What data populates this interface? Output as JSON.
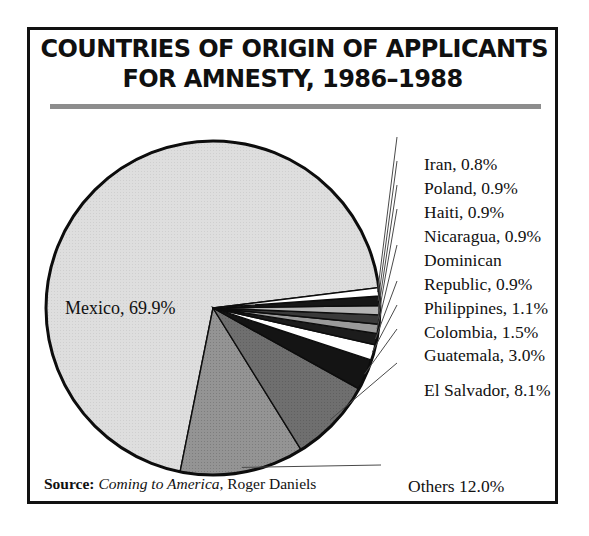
{
  "title": {
    "line1": "COUNTRIES OF ORIGIN OF APPLICANTS",
    "line2": "FOR AMNESTY, 1986–1988"
  },
  "source": {
    "label": "Source:",
    "work": "Coming to America",
    "author": ", Roger Daniels"
  },
  "bleed_text": "When争 of the applicants sought to today",
  "chart_data": {
    "type": "pie",
    "title": "COUNTRIES OF ORIGIN OF APPLICANTS FOR AMNESTY, 1986–1988",
    "unit": "percent",
    "legend": "none",
    "labels_inline": true,
    "categories": [
      "Mexico",
      "Others",
      "El Salvador",
      "Guatemala",
      "Colombia",
      "Philippines",
      "Dominican Republic",
      "Nicaragua",
      "Haiti",
      "Poland",
      "Iran"
    ],
    "values": [
      69.9,
      12.0,
      8.1,
      3.0,
      1.5,
      1.1,
      0.9,
      0.9,
      0.9,
      0.9,
      0.8
    ],
    "slice_labels": [
      "Mexico, 69.9%",
      "Others 12.0%",
      "El Salvador, 8.1%",
      "Guatemala, 3.0%",
      "Colombia, 1.5%",
      "Philippines, 1.1%",
      "Dominican Republic, 0.9%",
      "Nicaragua, 0.9%",
      "Haiti, 0.9%",
      "Poland, 0.9%",
      "Iran, 0.8%"
    ],
    "colors": [
      "#dcdcdc",
      "#8f8f8f",
      "#6e6e6e",
      "#141414",
      "#ffffff",
      "#1c1c1c",
      "#9a9a9a",
      "#3a3a3a",
      "#b4b4b4",
      "#161616",
      "#ffffff"
    ],
    "start_angle_deg": -7,
    "direction": "counterclockwise",
    "center": [
      210,
      305
    ],
    "radius": 167
  },
  "callouts": [
    {
      "key": "iran",
      "text": "Iran, 0.8%",
      "x": 420,
      "y": 134
    },
    {
      "key": "poland",
      "text": "Poland, 0.9%",
      "x": 420,
      "y": 158
    },
    {
      "key": "haiti",
      "text": "Haiti, 0.9%",
      "x": 420,
      "y": 182
    },
    {
      "key": "nicaragua",
      "text": "Nicaragua, 0.9%",
      "x": 420,
      "y": 206
    },
    {
      "key": "dominican",
      "text": "Dominican",
      "x": 420,
      "y": 230
    },
    {
      "key": "republic",
      "text": "Republic, 0.9%",
      "x": 420,
      "y": 254
    },
    {
      "key": "philippines",
      "text": "Philippines, 1.1%",
      "x": 420,
      "y": 278
    },
    {
      "key": "colombia",
      "text": "Colombia, 1.5%",
      "x": 420,
      "y": 302
    },
    {
      "key": "guatemala",
      "text": "Guatemala, 3.0%",
      "x": 420,
      "y": 326
    },
    {
      "key": "elsalvador",
      "text": "El Salvador, 8.1%",
      "x": 420,
      "y": 360
    },
    {
      "key": "others",
      "text": "Others 12.0%",
      "x": 404,
      "y": 468
    },
    {
      "key": "mexico",
      "text": "Mexico, 69.9%",
      "x": 62,
      "y": 296
    }
  ]
}
